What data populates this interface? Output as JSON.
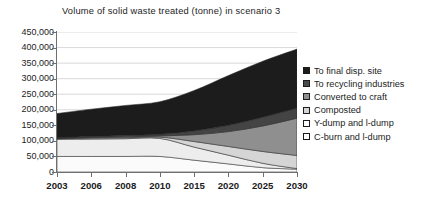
{
  "chart_data": {
    "type": "area",
    "stacked": true,
    "title": "Volume of solid waste treated (tonne) in scenario 3",
    "xlabel": "",
    "ylabel": "",
    "categories": [
      "2003",
      "2006",
      "2008",
      "2010",
      "2015",
      "2020",
      "2025",
      "2030"
    ],
    "x_positions": [
      2003,
      2006,
      2008,
      2010,
      2015,
      2020,
      2025,
      2030
    ],
    "ylim": [
      0,
      450000
    ],
    "ytick_step": 50000,
    "yticks": [
      "450,000",
      "400,000",
      "350,000",
      "300,000",
      "250,000",
      "200,000",
      "150,000",
      "100,000",
      "50,000",
      "0"
    ],
    "ytick_values": [
      450000,
      400000,
      350000,
      300000,
      250000,
      200000,
      150000,
      100000,
      50000,
      0
    ],
    "grid": true,
    "grid_axis": "y",
    "legend_position": "right",
    "stack_order_bottom_to_top": [
      "C-burn and l-dump",
      "Y-dump and l-dump",
      "Composted",
      "Converted to craft",
      "To recycling industries",
      "To final disp. site"
    ],
    "series": [
      {
        "name": "To final disp. site",
        "color": "#1c1c1c",
        "values": [
          78000,
          88000,
          97000,
          105000,
          130000,
          160000,
          180000,
          190000
        ]
      },
      {
        "name": "To recycling industries",
        "color": "#444444",
        "values": [
          2000,
          3000,
          4000,
          5000,
          12000,
          20000,
          28000,
          32000
        ]
      },
      {
        "name": "Converted to craft",
        "color": "#8f8f8f",
        "values": [
          1000,
          2000,
          3000,
          4000,
          22000,
          48000,
          82000,
          120000
        ]
      },
      {
        "name": "Composted",
        "color": "#d5d5d5",
        "values": [
          2000,
          3000,
          3000,
          4000,
          18000,
          28000,
          38000,
          42000
        ]
      },
      {
        "name": "Y-dump and l-dump",
        "color": "#ededed",
        "values": [
          55000,
          56000,
          57000,
          58000,
          42000,
          28000,
          14000,
          2000
        ]
      },
      {
        "name": "C-burn and l-dump",
        "color": "#fbfbfb",
        "values": [
          50000,
          50000,
          50000,
          50000,
          38000,
          26000,
          14000,
          9000
        ]
      }
    ],
    "totals": [
      188000,
      202000,
      214000,
      226000,
      262000,
      310000,
      356000,
      395000
    ]
  },
  "legend": {
    "items": [
      {
        "label": "To final disp. site",
        "swatch": "#1c1c1c"
      },
      {
        "label": "To recycling industries",
        "swatch": "#4a4a4a"
      },
      {
        "label": "Converted to craft",
        "swatch": "#8f8f8f"
      },
      {
        "label": "Composted",
        "swatch": "#d5d5d5"
      },
      {
        "label": "Y-dump and l-dump",
        "swatch": "#ffffff"
      },
      {
        "label": "C-burn and l-dump",
        "swatch": "#ffffff"
      }
    ]
  }
}
